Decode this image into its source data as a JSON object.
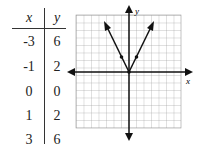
{
  "table": {
    "headers": [
      "x",
      "y"
    ],
    "rows": [
      {
        "x": "-3",
        "y": "6"
      },
      {
        "x": "-1",
        "y": "2"
      },
      {
        "x": "0",
        "y": "0"
      },
      {
        "x": "1",
        "y": "2"
      },
      {
        "x": "3",
        "y": "6"
      }
    ]
  },
  "graph": {
    "x_axis_label": "x",
    "y_axis_label": "y",
    "function": "y = 2|x|",
    "points": [
      [
        -1,
        2
      ],
      [
        0,
        0
      ],
      [
        1,
        2
      ]
    ]
  }
}
